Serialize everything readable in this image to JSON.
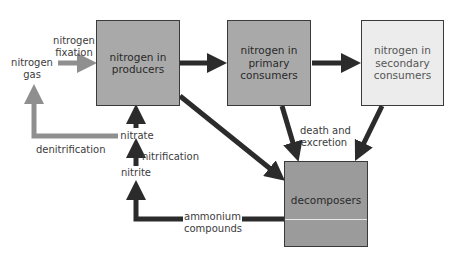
{
  "diagram": {
    "colors": {
      "dark_arrow": "#2b2b2b",
      "grey_arrow": "#8f8f8f",
      "producers_fill": "#a9a9a9",
      "primary_fill": "#a9a9a9",
      "secondary_fill": "#ececec",
      "decomposers_fill": "#9b9b9b"
    },
    "nodes": {
      "producers": "nitrogen in producers",
      "primary": "nitrogen in primary consumers",
      "secondary": "nitrogen in secondary consumers",
      "decomposers": "decomposers",
      "nitrogen_gas": "nitrogen gas",
      "nitrate": "nitrate",
      "nitrite": "nitrite"
    },
    "process_labels": {
      "fixation": "nitrogen fixation",
      "denitrification": "denitrification",
      "nitrification": "nitrification",
      "death_excretion": "death and excretion",
      "ammonium": "ammonium compounds"
    },
    "lines": {
      "producers_1": "nitrogen in",
      "producers_2": "producers",
      "primary_1": "nitrogen in",
      "primary_2": "primary",
      "primary_3": "consumers",
      "secondary_1": "nitrogen in",
      "secondary_2": "secondary",
      "secondary_3": "consumers",
      "gas_1": "nitrogen",
      "gas_2": "gas",
      "fix_1": "nitrogen",
      "fix_2": "fixation",
      "death_1": "death and",
      "death_2": "excretion",
      "amm_1": "ammonium",
      "amm_2": "compounds"
    },
    "edges": [
      {
        "from": "nitrogen gas",
        "to": "nitrogen in producers",
        "label": "nitrogen fixation",
        "style": "grey"
      },
      {
        "from": "nitrogen in producers",
        "to": "nitrogen in primary consumers",
        "style": "dark"
      },
      {
        "from": "nitrogen in primary consumers",
        "to": "nitrogen in secondary consumers",
        "style": "dark"
      },
      {
        "from": "nitrogen in producers",
        "to": "decomposers",
        "style": "dark"
      },
      {
        "from": "nitrogen in primary consumers",
        "to": "decomposers",
        "label": "death and excretion",
        "style": "dark"
      },
      {
        "from": "nitrogen in secondary consumers",
        "to": "decomposers",
        "style": "dark"
      },
      {
        "from": "decomposers",
        "to": "nitrite",
        "label": "ammonium compounds",
        "style": "dark"
      },
      {
        "from": "nitrite",
        "to": "nitrate",
        "label": "nitrification",
        "style": "dark"
      },
      {
        "from": "nitrate",
        "to": "nitrogen in producers",
        "style": "dark"
      },
      {
        "from": "nitrate",
        "to": "nitrogen gas",
        "label": "denitrification",
        "style": "grey"
      }
    ]
  }
}
